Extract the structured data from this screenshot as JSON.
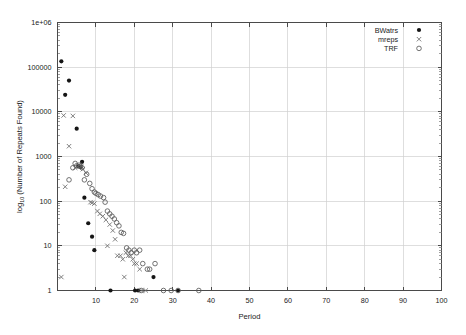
{
  "chart_data": {
    "type": "scatter",
    "title": "",
    "xlabel": "Period",
    "ylabel": "log10 (Number of Repeats Found)",
    "ylabel_base": "log",
    "ylabel_sub": "10",
    "ylabel_rest": " (Number of Repeats Found)",
    "xlim": [
      0,
      100
    ],
    "ylim": [
      1,
      1000000
    ],
    "yscale": "log",
    "xscale": "linear",
    "grid": true,
    "legend_position": "top-right",
    "xticks": [
      0,
      10,
      20,
      30,
      40,
      50,
      60,
      70,
      80,
      90,
      100
    ],
    "xticklabels": [
      "",
      "10",
      "20",
      "30",
      "40",
      "50",
      "60",
      "70",
      "80",
      "90",
      "100"
    ],
    "yticks": [
      1,
      10,
      100,
      1000,
      10000,
      100000,
      1000000
    ],
    "yticklabels": [
      "1",
      "10",
      "100",
      "1000",
      "10000",
      "100000",
      "1e+06"
    ],
    "series": [
      {
        "name": "BWatrs",
        "marker": "filled-circle",
        "color": "#151515",
        "points": [
          [
            1,
            135000
          ],
          [
            2,
            24000
          ],
          [
            3,
            50000
          ],
          [
            5,
            4200
          ],
          [
            5.4,
            600
          ],
          [
            6,
            580
          ],
          [
            6.4,
            760
          ],
          [
            7,
            120
          ],
          [
            8,
            32
          ],
          [
            9,
            16
          ],
          [
            9.6,
            8
          ],
          [
            13.8,
            1
          ],
          [
            20.2,
            1
          ],
          [
            21,
            1
          ],
          [
            25,
            2
          ],
          [
            31.4,
            1
          ]
        ]
      },
      {
        "name": "mreps",
        "marker": "cross",
        "color": "#6a6a6a",
        "points": [
          [
            1,
            2
          ],
          [
            1.6,
            8300
          ],
          [
            2,
            210
          ],
          [
            3,
            1700
          ],
          [
            4,
            8100
          ],
          [
            4.6,
            560
          ],
          [
            5.6,
            640
          ],
          [
            6.2,
            600
          ],
          [
            6.6,
            520
          ],
          [
            7.4,
            430
          ],
          [
            8.6,
            95
          ],
          [
            9,
            92
          ],
          [
            9.6,
            88
          ],
          [
            10.4,
            60
          ],
          [
            11,
            52
          ],
          [
            11.8,
            46
          ],
          [
            12.6,
            38
          ],
          [
            13,
            10
          ],
          [
            13.6,
            30
          ],
          [
            14.4,
            22
          ],
          [
            15,
            14
          ],
          [
            15.6,
            6
          ],
          [
            16.4,
            6
          ],
          [
            17,
            5
          ],
          [
            17.4,
            2
          ],
          [
            17.8,
            7
          ],
          [
            18.4,
            6
          ],
          [
            19,
            6
          ],
          [
            19.6,
            5
          ],
          [
            20,
            4
          ],
          [
            20.6,
            4
          ],
          [
            21.4,
            3
          ],
          [
            22,
            1
          ],
          [
            23,
            1
          ]
        ]
      },
      {
        "name": "TRF",
        "marker": "open-circle",
        "color": "#5a5a5a",
        "points": [
          [
            3,
            300
          ],
          [
            4,
            560
          ],
          [
            4.6,
            700
          ],
          [
            5,
            620
          ],
          [
            5.6,
            640
          ],
          [
            6,
            600
          ],
          [
            6.4,
            560
          ],
          [
            7,
            300
          ],
          [
            7.6,
            400
          ],
          [
            8.4,
            250
          ],
          [
            9,
            190
          ],
          [
            9.6,
            160
          ],
          [
            10,
            150
          ],
          [
            10.6,
            140
          ],
          [
            11.2,
            130
          ],
          [
            12,
            120
          ],
          [
            12.4,
            95
          ],
          [
            13,
            60
          ],
          [
            13.6,
            52
          ],
          [
            14.2,
            46
          ],
          [
            14.8,
            40
          ],
          [
            15.4,
            33
          ],
          [
            16,
            28
          ],
          [
            16.6,
            20
          ],
          [
            17.2,
            19
          ],
          [
            18,
            9
          ],
          [
            18.6,
            8
          ],
          [
            19.2,
            7
          ],
          [
            20,
            8
          ],
          [
            20.6,
            7
          ],
          [
            21.4,
            8
          ],
          [
            22.2,
            4
          ],
          [
            23.4,
            3
          ],
          [
            24,
            3
          ],
          [
            25.4,
            4
          ],
          [
            21.8,
            1
          ],
          [
            27.6,
            1
          ],
          [
            29.6,
            1
          ],
          [
            31.4,
            1
          ],
          [
            36.8,
            1
          ]
        ]
      }
    ]
  },
  "legend": {
    "items": [
      {
        "label": "BWatrs",
        "marker": "filled-circle"
      },
      {
        "label": "mreps",
        "marker": "cross"
      },
      {
        "label": "TRF",
        "marker": "open-circle"
      }
    ]
  },
  "colors": {
    "axis": "#4a4a4a",
    "grid": "#d0d0d0",
    "text": "#1a1a1a",
    "background": "#ffffff"
  }
}
